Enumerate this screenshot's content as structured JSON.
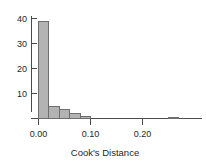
{
  "chart_data": {
    "type": "bar",
    "title": "",
    "subtitle": "",
    "xlabel": "Cook's Distance",
    "ylabel": "",
    "grid": false,
    "legend": false,
    "legend_position": "none",
    "bin_width": 0.02,
    "xlim": [
      -0.012,
      0.285
    ],
    "ylim": [
      0,
      41
    ],
    "xticks": [
      0.0,
      0.1,
      0.2
    ],
    "xtick_labels": [
      "0.00",
      "0.10",
      "0.20"
    ],
    "yticks": [
      10,
      20,
      30,
      40
    ],
    "ytick_labels": [
      "10",
      "20",
      "30",
      "40"
    ],
    "categories": [
      "0.00-0.02",
      "0.02-0.04",
      "0.04-0.06",
      "0.06-0.08",
      "0.08-0.10",
      "0.25-0.27"
    ],
    "x": [
      0.0,
      0.02,
      0.04,
      0.06,
      0.08,
      0.25
    ],
    "values": [
      39,
      5,
      3.5,
      2,
      1,
      0.5
    ],
    "bar_fill_color": "#b3b3b3",
    "bar_edge_color": "#6e6e6e",
    "axis_color": "#4a4a4a",
    "text_color": "#1f1f1f",
    "background_color": "#ffffff"
  },
  "axis": {
    "x_title": "Cook's Distance",
    "y_title": ""
  },
  "ticks": {
    "y": {
      "t40": "40",
      "t30": "30",
      "t20": "20",
      "t10": "10"
    },
    "x": {
      "t000": "0.00",
      "t010": "0.10",
      "t020": "0.20"
    }
  }
}
